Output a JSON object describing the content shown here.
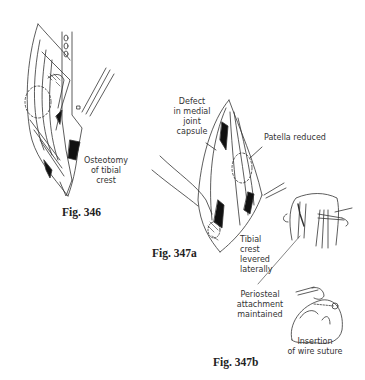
{
  "figures": [
    {
      "id": "fig346",
      "caption": "Fig. 346",
      "labels": {
        "osteotomy_line1": "Osteotomy",
        "osteotomy_line2": "of tibial",
        "osteotomy_line3": "crest"
      }
    },
    {
      "id": "fig347a",
      "caption": "Fig. 347a",
      "labels": {
        "defect_line1": "Defect",
        "defect_line2": "in medial",
        "defect_line3": "joint",
        "defect_line4": "capsule",
        "patella": "Patella reduced",
        "tibial_line1": "Tibial",
        "tibial_line2": "crest",
        "tibial_line3": "levered",
        "tibial_line4": "laterally"
      }
    },
    {
      "id": "fig347b",
      "caption": "Fig. 347b",
      "labels": {
        "periosteal_line1": "Periosteal",
        "periosteal_line2": "attachment",
        "periosteal_line3": "maintained",
        "insertion_line1": "Insertion",
        "insertion_line2": "of wire suture"
      }
    }
  ]
}
